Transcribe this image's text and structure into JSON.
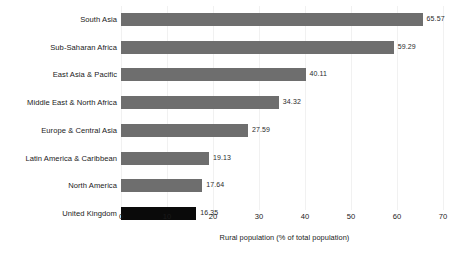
{
  "chart_data": {
    "type": "bar",
    "orientation": "horizontal",
    "title": "",
    "xlabel": "Rural population (% of total population)",
    "ylabel": "",
    "xlim": [
      0,
      70
    ],
    "xticks": [
      0,
      10,
      20,
      30,
      40,
      50,
      60,
      70
    ],
    "xtick_labels": [
      "0",
      "10",
      "20",
      "30",
      "40",
      "50",
      "60",
      "70"
    ],
    "grid": true,
    "grid_axis": "x",
    "legend": false,
    "categories": [
      "South Asia",
      "Sub-Saharan Africa",
      "East Asia & Pacific",
      "Middle East & North Africa",
      "Europe & Central Asia",
      "Latin America & Caribbean",
      "North America",
      "United Kingdom"
    ],
    "values": [
      65.57,
      59.29,
      40.11,
      34.32,
      27.59,
      19.13,
      17.64,
      16.35
    ],
    "value_labels": [
      "65.57",
      "59.29",
      "40.11",
      "34.32",
      "27.59",
      "19.13",
      "17.64",
      "16.35"
    ],
    "bar_colors": [
      "#6e6e6e",
      "#6e6e6e",
      "#6e6e6e",
      "#6e6e6e",
      "#6e6e6e",
      "#6e6e6e",
      "#6e6e6e",
      "#0a0a0a"
    ],
    "highlight_category": "United Kingdom",
    "colors": {
      "background": "#ffffff",
      "bar_default": "#6e6e6e",
      "bar_highlight": "#0a0a0a",
      "gridline": "#f1f1f1",
      "text": "#1a1a1a"
    }
  }
}
